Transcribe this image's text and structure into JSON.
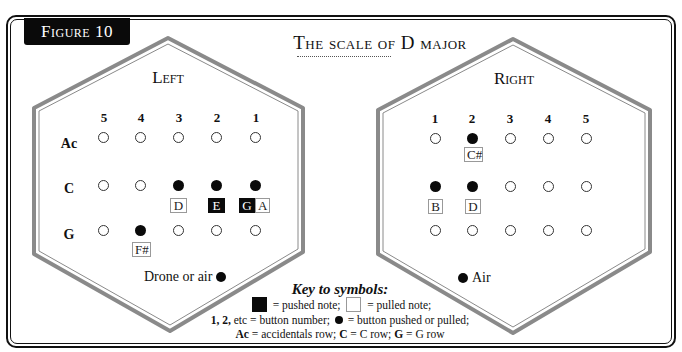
{
  "figure_label": "Figure 10",
  "title": "The scale of D major",
  "left": {
    "title": "Left",
    "columns": [
      "5",
      "4",
      "3",
      "2",
      "1"
    ],
    "rows": [
      {
        "label": "Ac",
        "buttons": [
          "open",
          "open",
          "open",
          "open",
          "open"
        ]
      },
      {
        "label": "C",
        "buttons": [
          "open",
          "open",
          "filled",
          "filled",
          "filled"
        ]
      },
      {
        "label": "G",
        "buttons": [
          "open",
          "filled",
          "open",
          "open",
          "open"
        ]
      }
    ],
    "notes": [
      {
        "text": "D",
        "type": "pulled",
        "row": "C",
        "column": "3"
      },
      {
        "text": "E",
        "type": "pushed",
        "row": "C",
        "column": "2"
      },
      {
        "text": "G",
        "type": "pushed",
        "row": "C",
        "column": "1"
      },
      {
        "text": "A",
        "type": "pulled",
        "row": "C",
        "column": "1"
      },
      {
        "text": "F#",
        "type": "pulled",
        "row": "G",
        "column": "4"
      }
    ],
    "aux_label": "Drone or air"
  },
  "right": {
    "title": "Right",
    "columns": [
      "1",
      "2",
      "3",
      "4",
      "5"
    ],
    "rows": [
      {
        "label": "Ac",
        "buttons": [
          "open",
          "filled",
          "open",
          "open",
          "open"
        ]
      },
      {
        "label": "C",
        "buttons": [
          "filled",
          "filled",
          "open",
          "open",
          "open"
        ]
      },
      {
        "label": "G",
        "buttons": [
          "open",
          "open",
          "open",
          "open",
          "open"
        ]
      }
    ],
    "notes": [
      {
        "text": "C#",
        "type": "pulled",
        "row": "Ac",
        "column": "2"
      },
      {
        "text": "B",
        "type": "pulled",
        "row": "C",
        "column": "1"
      },
      {
        "text": "D",
        "type": "pulled",
        "row": "C",
        "column": "2"
      }
    ],
    "aux_label": "Air"
  },
  "key": {
    "title": "Key to symbols:",
    "pushed": "= pushed note;",
    "pulled": "= pulled note;",
    "numbers_bold": "1, 2,",
    "numbers_text": "etc = button number;",
    "dot_text": "= button pushed or pulled;",
    "ac_bold": "Ac",
    "ac_text": "= accidentals row;",
    "c_bold": "C",
    "c_text": "= C row;",
    "g_bold": "G",
    "g_text": "= G row"
  },
  "colors": {
    "ink": "#0a0a0a",
    "hex_outline": "#8a8a8a",
    "note_border": "#999999"
  }
}
